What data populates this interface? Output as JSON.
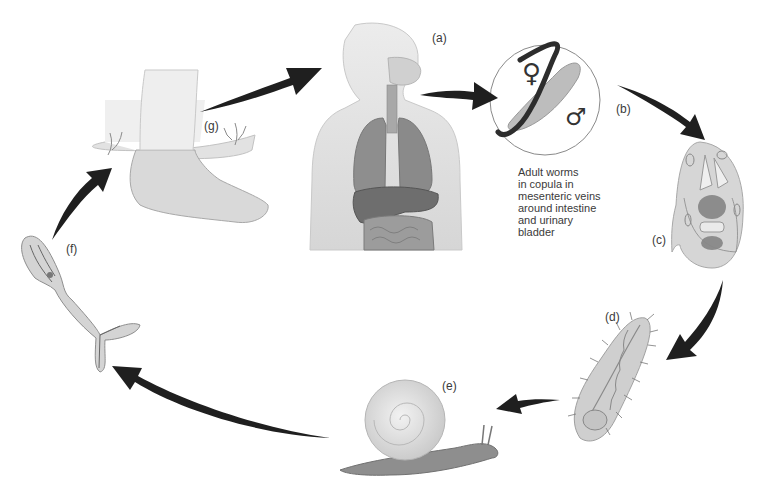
{
  "diagram": {
    "type": "life-cycle",
    "stages": [
      {
        "id": "a",
        "label": "(a)",
        "subject": "human host (torso with lungs, liver, intestines)"
      },
      {
        "id": "b",
        "label": "(b)",
        "subject": "adult male and female worms",
        "symbols": [
          "♀",
          "♂"
        ]
      },
      {
        "id": "c",
        "label": "(c)",
        "subject": "egg containing miracidium"
      },
      {
        "id": "d",
        "label": "(d)",
        "subject": "ciliated miracidium"
      },
      {
        "id": "e",
        "label": "(e)",
        "subject": "snail intermediate host"
      },
      {
        "id": "f",
        "label": "(f)",
        "subject": "fork-tailed cercaria"
      },
      {
        "id": "g",
        "label": "(g)",
        "subject": "human foot in water"
      }
    ],
    "caption_b": [
      "Adult worms",
      "in copula in",
      "mesenteric veins",
      "around intestine",
      "and urinary",
      "bladder"
    ],
    "flow": [
      "a",
      "b",
      "c",
      "d",
      "e",
      "f",
      "g",
      "a"
    ],
    "colors": {
      "arrow": "#1f1f1f",
      "body_fill": "#e4e4e4",
      "organ_fill": "#8d8d8d",
      "outline": "#9a9a9a",
      "background": "#ffffff"
    }
  }
}
